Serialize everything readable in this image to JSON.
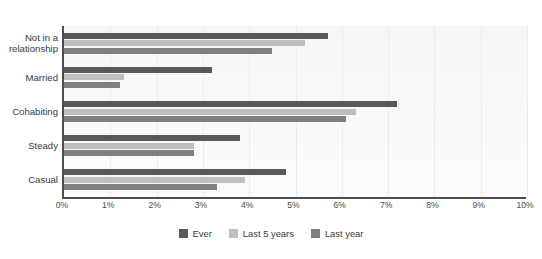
{
  "figure": {
    "title": "Figure 1: Proportion of people reporting having had a sexually transmitted infection, by relationship status",
    "title_clipped": true
  },
  "legend": {
    "position": "bottom-center",
    "items": [
      {
        "label": "Ever",
        "color": "#595959",
        "swatch_name": "legend-swatch-ever"
      },
      {
        "label": "Last 5 years",
        "color": "#bfbfbf",
        "swatch_name": "legend-swatch-last-5-years"
      },
      {
        "label": "Last year",
        "color": "#808080",
        "swatch_name": "legend-swatch-last-year"
      }
    ]
  },
  "axis": {
    "x_ticks": [
      "0%",
      "1%",
      "2%",
      "3%",
      "4%",
      "5%",
      "6%",
      "7%",
      "8%",
      "9%",
      "10%"
    ],
    "x_min": 0,
    "x_max": 10,
    "grid": true
  },
  "chart_data": {
    "type": "bar",
    "orientation": "horizontal",
    "title": "Figure 1: Proportion of people reporting having had a sexually transmitted infection, by relationship status",
    "xlabel": "",
    "ylabel": "",
    "xlim": [
      0,
      10
    ],
    "xticks": [
      0,
      1,
      2,
      3,
      4,
      5,
      6,
      7,
      8,
      9,
      10
    ],
    "xtick_labels": [
      "0%",
      "1%",
      "2%",
      "3%",
      "4%",
      "5%",
      "6%",
      "7%",
      "8%",
      "9%",
      "10%"
    ],
    "grid": true,
    "legend_position": "bottom-center",
    "categories": [
      "Not in a relationship",
      "Married",
      "Cohabiting",
      "Steady",
      "Casual"
    ],
    "series": [
      {
        "name": "Ever",
        "color": "#595959",
        "values": [
          5.7,
          3.2,
          7.2,
          3.8,
          4.8
        ]
      },
      {
        "name": "Last 5 years",
        "color": "#bfbfbf",
        "values": [
          5.2,
          1.3,
          6.3,
          2.8,
          3.9
        ]
      },
      {
        "name": "Last year",
        "color": "#808080",
        "values": [
          4.5,
          1.2,
          6.1,
          2.8,
          3.3
        ]
      }
    ]
  }
}
